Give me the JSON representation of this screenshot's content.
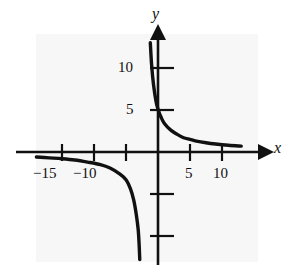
{
  "figure": {
    "name": "rational-function-graph",
    "background_color": "#ffffff",
    "panel_color": "#f7f7f7",
    "ink_color": "#111111"
  },
  "chart_data": {
    "type": "line",
    "title": "",
    "subtitle": "",
    "xlabel": "x",
    "ylabel": "y",
    "xlim": [
      -19,
      14
    ],
    "ylim": [
      -13,
      14
    ],
    "grid": false,
    "legend": null,
    "annotations": [],
    "axes": {
      "x_axis_label": "x",
      "y_axis_label": "y",
      "x_ticks": [
        -15,
        -10,
        -5,
        5,
        10
      ],
      "x_tick_labels": [
        "−15",
        "−10",
        "",
        "5",
        "10"
      ],
      "y_ticks": [
        5,
        10,
        -5,
        -10
      ],
      "y_tick_labels": [
        "5",
        "10",
        "",
        ""
      ],
      "x_arrow": true,
      "y_arrow": true,
      "origin_labeled": false
    },
    "asymptotes": {
      "vertical": -2,
      "horizontal": 0
    },
    "series": [
      {
        "name": "branch-right",
        "description": "decreasing branch in quadrant I approaching y=0 from above",
        "points": [
          [
            -1.2,
            13.0
          ],
          [
            -1.0,
            10.4
          ],
          [
            -0.7,
            8.0
          ],
          [
            -0.3,
            6.0
          ],
          [
            0.0,
            5.1
          ],
          [
            0.5,
            4.1
          ],
          [
            1.0,
            3.4
          ],
          [
            2.0,
            2.6
          ],
          [
            3.0,
            2.1
          ],
          [
            4.0,
            1.7
          ],
          [
            5.0,
            1.5
          ],
          [
            6.0,
            1.3
          ],
          [
            7.5,
            1.1
          ],
          [
            9.0,
            0.95
          ],
          [
            11.0,
            0.8
          ],
          [
            13.0,
            0.7
          ]
        ]
      },
      {
        "name": "branch-left",
        "description": "decreasing branch in quadrant III approaching y=0 from below",
        "points": [
          [
            -19.0,
            -0.6
          ],
          [
            -17.0,
            -0.7
          ],
          [
            -15.0,
            -0.8
          ],
          [
            -13.0,
            -0.95
          ],
          [
            -11.0,
            -1.2
          ],
          [
            -9.0,
            -1.5
          ],
          [
            -7.5,
            -1.9
          ],
          [
            -6.0,
            -2.6
          ],
          [
            -5.0,
            -3.3
          ],
          [
            -4.3,
            -4.4
          ],
          [
            -3.8,
            -5.7
          ],
          [
            -3.4,
            -7.4
          ],
          [
            -3.1,
            -9.2
          ],
          [
            -2.95,
            -11.0
          ],
          [
            -2.85,
            -12.8
          ]
        ]
      }
    ]
  }
}
